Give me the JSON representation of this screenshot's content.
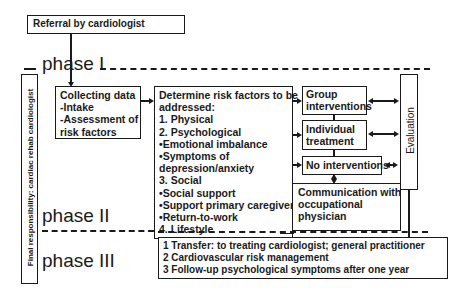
{
  "referral": {
    "label": "Referral by cardiologist"
  },
  "phases": {
    "phase1": "phase I",
    "phase2": "phase II",
    "phase3": "phase III"
  },
  "responsibility": {
    "label": "Final responsibility: cardiac rehab cardiologist"
  },
  "collecting": {
    "lines": [
      "Collecting data",
      "-Intake",
      "-Assessment of",
      "risk factors"
    ]
  },
  "risk_factors": {
    "lines": [
      "Determine risk factors to be",
      "addressed:",
      "1. Physical",
      "2. Psychological",
      "•Emotional  imbalance",
      "•Symptoms of",
      "depression/anxiety",
      "3. Social",
      "•Social support",
      "•Support primary caregiver",
      "•Return-to-work",
      "4. Lifestyle"
    ]
  },
  "interventions": {
    "group": [
      "Group",
      "interventions"
    ],
    "individual": [
      "Individual",
      "treatment"
    ],
    "none": "No interventions"
  },
  "communication": {
    "lines": [
      "Communication with",
      "occupational",
      "physician"
    ]
  },
  "evaluation": {
    "label": "Evaluation"
  },
  "phase3_box": {
    "lines": [
      "1 Transfer: to treating cardiologist; general practitioner",
      "2 Cardiovascular risk management",
      "3 Follow-up psychological symptoms after one year"
    ]
  }
}
